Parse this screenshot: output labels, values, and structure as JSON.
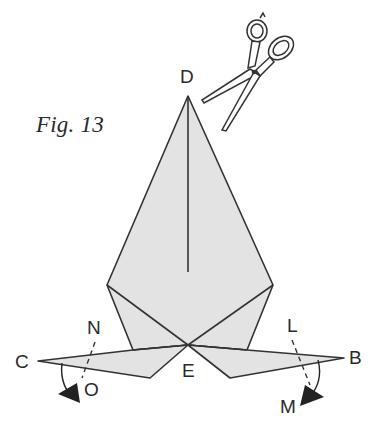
{
  "figure": {
    "caption": "Fig. 13",
    "type": "origami folding diagram",
    "colors": {
      "paper_fill": "#e3e3e3",
      "outline": "#333333",
      "arrow": "#222222",
      "background": "#ffffff"
    },
    "icons": {
      "scissors": "scissors-icon"
    },
    "points": {
      "D": {
        "label": "D",
        "x": 188,
        "y": 96
      },
      "E": {
        "label": "E",
        "x": 188,
        "y": 345
      },
      "C": {
        "label": "C",
        "x": 38,
        "y": 361
      },
      "B": {
        "label": "B",
        "x": 344,
        "y": 358
      },
      "N": {
        "label": "N"
      },
      "O": {
        "label": "O"
      },
      "L": {
        "label": "L"
      },
      "M": {
        "label": "M"
      }
    },
    "annotations": [
      {
        "type": "cut",
        "description": "scissors near point D"
      },
      {
        "type": "fold-arrow",
        "from": "N",
        "to": "O",
        "side": "left"
      },
      {
        "type": "fold-arrow",
        "from": "L",
        "to": "M",
        "side": "right"
      }
    ]
  }
}
